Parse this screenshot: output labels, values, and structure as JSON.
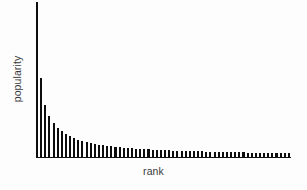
{
  "chart_data": {
    "type": "bar",
    "title": "",
    "subtitle": "",
    "xlabel": "rank",
    "ylabel": "popularity",
    "grid": false,
    "legend": null,
    "legend_position": "none",
    "annotations": [],
    "xtick_labels": [],
    "ytick_labels": [],
    "xlim": [
      1,
      62
    ],
    "ylim": [
      0,
      100
    ],
    "bar_color": "#0d0d0d",
    "background_color": "#fdfdfd",
    "axis_color": "#111111",
    "label_color": "#3a3a3a",
    "categories": [
      "1",
      "2",
      "3",
      "4",
      "5",
      "6",
      "7",
      "8",
      "9",
      "10",
      "11",
      "12",
      "13",
      "14",
      "15",
      "16",
      "17",
      "18",
      "19",
      "20",
      "21",
      "22",
      "23",
      "24",
      "25",
      "26",
      "27",
      "28",
      "29",
      "30",
      "31",
      "32",
      "33",
      "34",
      "35",
      "36",
      "37",
      "38",
      "39",
      "40",
      "41",
      "42",
      "43",
      "44",
      "45",
      "46",
      "47",
      "48",
      "49",
      "50",
      "51",
      "52",
      "53",
      "54",
      "55",
      "56",
      "57",
      "58",
      "59",
      "60",
      "61",
      "62"
    ],
    "values": [
      100.0,
      51.5,
      33.8,
      27.0,
      22.5,
      19.5,
      17.0,
      15.2,
      13.8,
      12.6,
      11.7,
      10.9,
      10.2,
      9.6,
      9.1,
      8.6,
      8.2,
      7.8,
      7.5,
      7.2,
      6.9,
      6.7,
      6.4,
      6.2,
      6.0,
      5.8,
      5.7,
      5.5,
      5.4,
      5.2,
      5.1,
      5.0,
      4.9,
      4.8,
      4.7,
      4.6,
      4.5,
      4.4,
      4.3,
      4.2,
      4.2,
      4.1,
      4.0,
      4.0,
      3.9,
      3.8,
      3.8,
      3.7,
      3.7,
      3.6,
      3.6,
      3.5,
      3.5,
      3.4,
      3.4,
      3.4,
      3.3,
      3.3,
      3.2,
      3.2,
      3.2,
      3.1
    ]
  },
  "axes": {
    "ylabel": "popularity",
    "xlabel": "rank"
  }
}
